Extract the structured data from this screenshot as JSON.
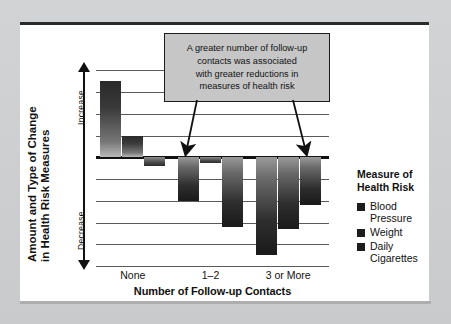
{
  "chart_data": {
    "type": "bar",
    "title": "",
    "xlabel": "Number of Follow-up Contacts",
    "ylabel": "Amount and Type of Change in Health Risk Measures",
    "categories": [
      "None",
      "1–2",
      "3 or More"
    ],
    "series": [
      {
        "name": "Blood Pressure",
        "values": [
          3.5,
          -2.0,
          -4.5
        ]
      },
      {
        "name": "Weight",
        "values": [
          1.0,
          -0.25,
          -3.3
        ]
      },
      {
        "name": "Daily Cigarettes",
        "values": [
          -0.4,
          -3.2,
          -2.2
        ]
      }
    ],
    "ylim": [
      -5.0,
      4.2
    ],
    "ytick_values": [
      4.0,
      3.0,
      2.0,
      1.0,
      0.0,
      -1.0,
      -2.0,
      -3.0,
      -4.0,
      -5.0
    ],
    "grid": true,
    "zero_line": true,
    "axis_direction_labels": {
      "positive": "Increase",
      "negative": "Decrease"
    },
    "legend_position": "right",
    "bar_style": "vertical-gradient-grayscale",
    "annotations": [
      {
        "text": "A greater number of follow-up contacts was associated with greater reductions in measures of health risk",
        "points_to": [
          "1–2",
          "3 or More"
        ],
        "arrows": 2
      }
    ]
  },
  "axes": {
    "y": {
      "title_line1": "Amount and Type of Change",
      "title_line2": "in Health Risk Measures",
      "increase_label": "Increase",
      "decrease_label": "Decrease"
    },
    "x": {
      "title": "Number of Follow-up Contacts",
      "ticks": [
        "None",
        "1–2",
        "3 or More"
      ]
    }
  },
  "callout": {
    "line1": "A greater number of follow-up",
    "line2": "contacts was associated",
    "line3": "with greater reductions in",
    "line4": "measures of health risk"
  },
  "legend": {
    "title_line1": "Measure of",
    "title_line2": "Health Risk",
    "items": [
      {
        "label_line1": "Blood",
        "label_line2": "Pressure"
      },
      {
        "label_line1": "Weight",
        "label_line2": ""
      },
      {
        "label_line1": "Daily",
        "label_line2": "Cigarettes"
      }
    ]
  },
  "colors": {
    "bar_dark": "#1d1d1d",
    "bar_light": "#b9b9b9",
    "callout_fill": "#c6c6c6",
    "frame": "#cfd0d1",
    "panel": "#ffffff",
    "ink": "#111111"
  }
}
